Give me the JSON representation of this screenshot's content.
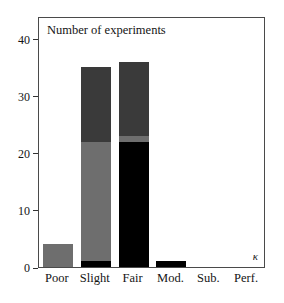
{
  "chart_data": {
    "type": "bar",
    "title": "Number of experiments",
    "xlabel": "κ",
    "ylabel": "",
    "categories": [
      "Poor",
      "Slight",
      "Fair",
      "Mod.",
      "Sub.",
      "Perf."
    ],
    "yticks": [
      0,
      10,
      20,
      30,
      40
    ],
    "ylim": [
      0,
      44
    ],
    "grid": false,
    "legend": "none",
    "stacked": true,
    "series": [
      {
        "name": "black-segment",
        "color": "#000000",
        "values": [
          0,
          1,
          22,
          1,
          0,
          0
        ]
      },
      {
        "name": "mid-gray-segment",
        "color": "#6e6e6e",
        "values": [
          4,
          21,
          1,
          0,
          0,
          0
        ]
      },
      {
        "name": "dark-gray-segment",
        "color": "#3a3a3a",
        "values": [
          0,
          13,
          13,
          0,
          0,
          0
        ]
      }
    ],
    "totals": [
      4,
      35,
      36,
      1,
      0,
      0
    ]
  },
  "axes": {
    "y_tick_labels": [
      "0",
      "10",
      "20",
      "30",
      "40"
    ],
    "x_tick_labels": [
      "Poor",
      "Slight",
      "Fair",
      "Mod.",
      "Sub.",
      "Perf."
    ],
    "kappa_label": "κ"
  },
  "colors": {
    "black": "#000000",
    "mid_gray": "#6e6e6e",
    "dark_gray": "#3a3a3a",
    "frame": "#4a4a4a",
    "background": "#ffffff",
    "text": "#141414"
  }
}
